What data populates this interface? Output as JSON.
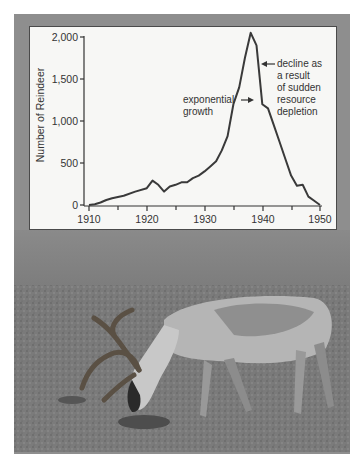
{
  "chart_data": {
    "type": "line",
    "title": "",
    "xlabel": "",
    "ylabel": "Number of Reindeer",
    "xlim": [
      1910,
      1950
    ],
    "ylim": [
      0,
      2000
    ],
    "x_ticks": [
      "1910",
      "1920",
      "1930",
      "1940",
      "1950"
    ],
    "y_ticks": [
      "0",
      "500",
      "1,000",
      "1,500",
      "2,000"
    ],
    "grid": false,
    "legend": null,
    "series": [
      {
        "name": "Reindeer population",
        "x": [
          1910,
          1911,
          1912,
          1913,
          1914,
          1916,
          1918,
          1920,
          1921,
          1922,
          1923,
          1924,
          1925,
          1926,
          1927,
          1928,
          1929,
          1930,
          1931,
          1932,
          1933,
          1934,
          1935,
          1936,
          1937,
          1938,
          1939,
          1940,
          1941,
          1942,
          1943,
          1944,
          1945,
          1946,
          1947,
          1948,
          1949,
          1950
        ],
        "values": [
          0,
          10,
          30,
          60,
          80,
          110,
          160,
          200,
          290,
          240,
          160,
          220,
          240,
          270,
          270,
          320,
          350,
          400,
          460,
          520,
          650,
          820,
          1200,
          1400,
          1750,
          2050,
          1900,
          1200,
          1150,
          950,
          750,
          550,
          350,
          230,
          240,
          100,
          50,
          0
        ]
      }
    ],
    "annotations": [
      {
        "text_lines": [
          "exponential",
          "growth"
        ],
        "arrow": "right",
        "target_year": 1936
      },
      {
        "text_lines": [
          "decline as",
          "a result",
          "of sudden",
          "resource",
          "depletion"
        ],
        "arrow": "left",
        "target_year": 1939
      }
    ]
  },
  "labels": {
    "ylabel": "Number of Reindeer",
    "y_ticks": [
      "2,000",
      "1,500",
      "1,000",
      "500",
      "0"
    ],
    "x_ticks": [
      "1910",
      "1920",
      "1930",
      "1940",
      "1950"
    ],
    "annotation_growth": [
      "exponential",
      "growth"
    ],
    "annotation_decline": [
      "decline as",
      "a result",
      "of sudden",
      "resource",
      "depletion"
    ]
  },
  "photo": {
    "subject": "reindeer grazing on tundra"
  },
  "colors": {
    "line": "#3a3a3a",
    "frame": "#8e8e8e",
    "panel": "#f7f7f5"
  }
}
